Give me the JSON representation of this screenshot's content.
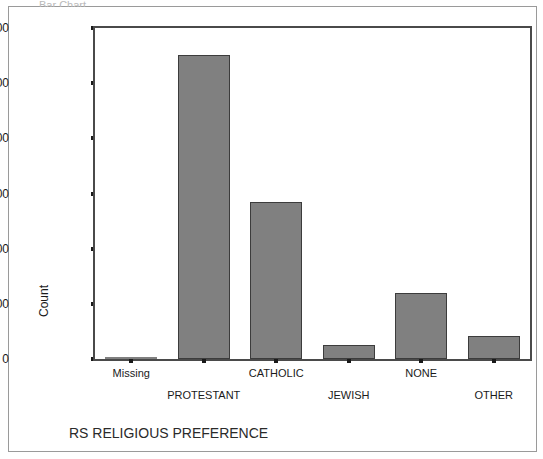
{
  "window": {
    "cropped_title_fragment": "Bar Chart"
  },
  "chart_data": {
    "type": "bar",
    "title": "",
    "xlabel": "RS RELIGIOUS PREFERENCE",
    "ylabel": "Count",
    "categories": [
      "Missing",
      "PROTESTANT",
      "CATHOLIC",
      "JEWISH",
      "NONE",
      "OTHER"
    ],
    "values": [
      0,
      1102,
      570,
      52,
      238,
      82
    ],
    "ylim": [
      0,
      1200
    ],
    "yticks": [
      0,
      200,
      400,
      600,
      800,
      1000,
      1200
    ],
    "ytick_labels": [
      "0",
      "200",
      "400",
      "600",
      "800",
      "1000",
      "1200"
    ],
    "grid": false,
    "legend": false,
    "bar_color": "#808080",
    "bar_edge_color": "#3c3c3c",
    "axis_color": "#4a4a4a",
    "label_rows": [
      0,
      1,
      0,
      1,
      0,
      1
    ]
  }
}
